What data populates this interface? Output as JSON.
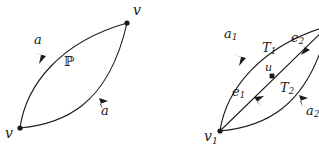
{
  "figure": {
    "background_color": "#ffffff",
    "ink_color": "#1a1a1a",
    "panels": [
      {
        "id": "left",
        "name": "bigon-single-edge",
        "description": "Bigon with two curved arcs between two vertices labelled v, interior labelled P",
        "vertices": [
          {
            "name": "v-bottom",
            "label": "v",
            "x": 20,
            "y": 128
          },
          {
            "name": "v-top",
            "label": "v",
            "x": 127,
            "y": 23
          }
        ],
        "edges": [
          {
            "name": "arc-upper",
            "label": "a",
            "direction": "up-right"
          },
          {
            "name": "arc-lower",
            "label": "a",
            "direction": "down-right"
          }
        ],
        "region_label": "ℙ"
      },
      {
        "id": "right",
        "name": "bigon-subdivided",
        "description": "Bigon subdivided by a diagonal through midpoint u into triangles T1 and T2",
        "vertices": [
          {
            "name": "v1",
            "label": "v",
            "sub": "1",
            "x": 60,
            "y": 131
          },
          {
            "name": "u",
            "label": "u",
            "x": 112,
            "y": 76
          }
        ],
        "edges": [
          {
            "name": "edge-a1",
            "label": "a",
            "sub": "1"
          },
          {
            "name": "edge-e2",
            "label": "e",
            "sub": "2"
          },
          {
            "name": "edge-e1",
            "label": "e",
            "sub": "1"
          },
          {
            "name": "edge-a2",
            "label": "a",
            "sub": "2"
          }
        ],
        "faces": [
          {
            "name": "triangle-T1",
            "label": "T",
            "sub": "1"
          },
          {
            "name": "triangle-T2",
            "label": "T",
            "sub": "2"
          }
        ]
      }
    ]
  },
  "labels": {
    "left": {
      "v_top": "v",
      "v_bottom": "v",
      "a_upper": "a",
      "a_lower": "a",
      "region": "ℙ"
    },
    "right": {
      "a1": "a",
      "a1_sub": "1",
      "e2": "e",
      "e2_sub": "2",
      "e1": "e",
      "e1_sub": "1",
      "a2": "a",
      "a2_sub": "2",
      "T1": "T",
      "T1_sub": "1",
      "T2": "T",
      "T2_sub": "2",
      "u": "u",
      "v1": "v",
      "v1_sub": "1"
    }
  }
}
